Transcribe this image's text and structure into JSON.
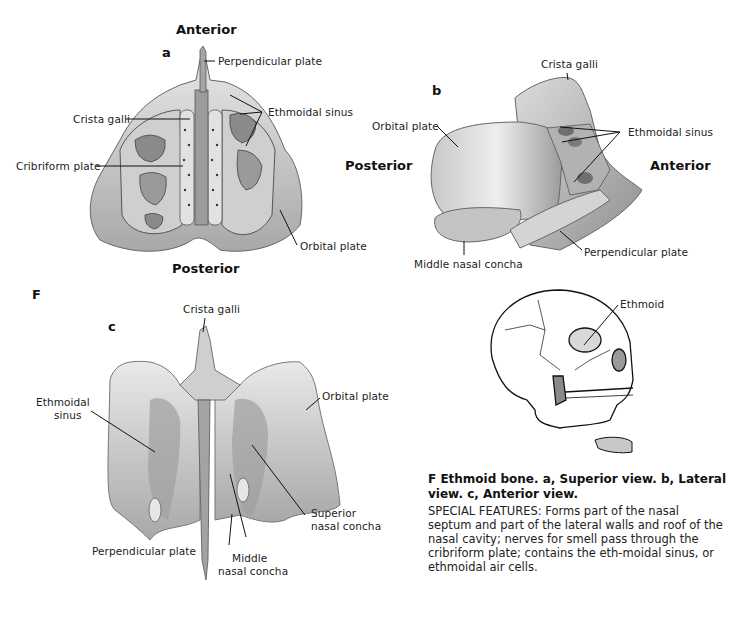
{
  "figure": {
    "letter": "F",
    "caption": "F Ethmoid bone. a, Superior view. b, Lateral view. c, Anterior view.",
    "description": "SPECIAL FEATURES: Forms part of the nasal septum and part of the lateral walls and roof of the nasal cavity; nerves for smell pass through the cribriform plate; contains the eth-moidal sinus, or ethmoidal air cells."
  },
  "panel_a": {
    "letter": "a",
    "view": "Superior view",
    "orientation_top": "Anterior",
    "orientation_bottom": "Posterior",
    "labels": [
      "Perpendicular plate",
      "Crista galli",
      "Ethmoidal sinus",
      "Cribriform plate",
      "Orbital plate"
    ]
  },
  "panel_b": {
    "letter": "b",
    "view": "Lateral view",
    "orientation_left": "Posterior",
    "orientation_right": "Anterior",
    "labels": [
      "Crista galli",
      "Orbital plate",
      "Ethmoidal sinus",
      "Middle nasal concha",
      "Perpendicular plate"
    ]
  },
  "panel_c": {
    "letter": "c",
    "view": "Anterior view",
    "labels": [
      "Crista galli",
      "Ethmoidal\nsinus",
      "Orbital plate",
      "Superior\nnasal concha",
      "Perpendicular plate",
      "Middle\nnasal concha"
    ],
    "label_lines": {
      "ethmoidal_1": "Ethmoidal",
      "ethmoidal_2": "sinus",
      "superior_1": "Superior",
      "superior_2": "nasal concha",
      "middle_1": "Middle",
      "middle_2": "nasal concha"
    }
  },
  "skull": {
    "label": "Ethmoid"
  },
  "colors": {
    "bone_light": "#e6e6e6",
    "bone_mid": "#b9b9b9",
    "bone_dark": "#7d7d7d",
    "line": "#111111"
  }
}
